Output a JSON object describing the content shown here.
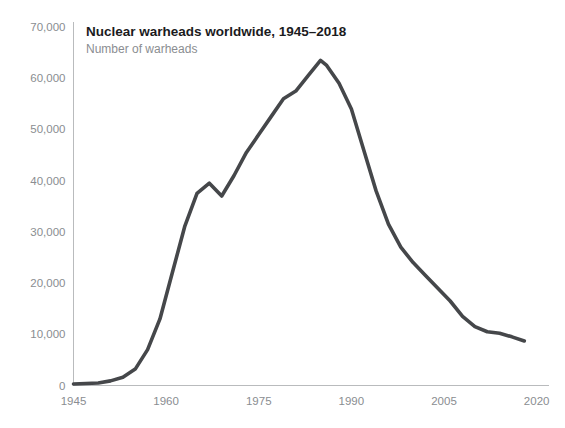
{
  "chart_data": {
    "type": "line",
    "title": "Nuclear warheads worldwide, 1945–2018",
    "subtitle": "Number of warheads",
    "xlabel": "",
    "ylabel": "",
    "legend": [],
    "grid": false,
    "xlim": [
      1945,
      2022
    ],
    "ylim": [
      0,
      70000
    ],
    "yticks": [
      0,
      10000,
      20000,
      30000,
      40000,
      50000,
      60000,
      70000
    ],
    "ytick_labels": [
      "0",
      "10,000",
      "20,000",
      "30,000",
      "40,000",
      "50,000",
      "60,000",
      "70,000"
    ],
    "xticks": [
      1945,
      1960,
      1975,
      1990,
      2005,
      2020
    ],
    "xtick_labels": [
      "1945",
      "1960",
      "1975",
      "1990",
      "2005",
      "2020"
    ],
    "series": [
      {
        "name": "Number of warheads",
        "color": "#45474a",
        "x": [
          1945,
          1947,
          1949,
          1951,
          1953,
          1955,
          1957,
          1959,
          1961,
          1963,
          1965,
          1967,
          1969,
          1971,
          1973,
          1975,
          1977,
          1979,
          1981,
          1983,
          1985,
          1986,
          1988,
          1990,
          1992,
          1994,
          1996,
          1998,
          2000,
          2002,
          2004,
          2006,
          2008,
          2010,
          2012,
          2014,
          2016,
          2018
        ],
        "y": [
          300,
          400,
          500,
          900,
          1600,
          3200,
          7000,
          13000,
          22000,
          31000,
          37500,
          39500,
          37000,
          41000,
          45500,
          49000,
          52500,
          56000,
          57500,
          60500,
          63500,
          62500,
          59000,
          54000,
          46000,
          38000,
          31500,
          27000,
          24000,
          21500,
          19000,
          16500,
          13500,
          11500,
          10500,
          10200,
          9500,
          8700
        ]
      }
    ]
  },
  "axes": {
    "y_axis_name": "y-axis",
    "x_axis_name": "x-axis"
  }
}
